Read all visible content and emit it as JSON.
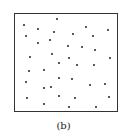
{
  "figure": {
    "caption": "(b)",
    "frame_color": "#333333",
    "dot_color": "#222222",
    "dots": [
      [
        57,
        19
      ],
      [
        24,
        25
      ],
      [
        38,
        29
      ],
      [
        86,
        27
      ],
      [
        108,
        30
      ],
      [
        26,
        36
      ],
      [
        54,
        32
      ],
      [
        73,
        34
      ],
      [
        93,
        36
      ],
      [
        38,
        43
      ],
      [
        50,
        40
      ],
      [
        68,
        46
      ],
      [
        82,
        47
      ],
      [
        95,
        50
      ],
      [
        30,
        57
      ],
      [
        52,
        54
      ],
      [
        69,
        58
      ],
      [
        110,
        58
      ],
      [
        59,
        63
      ],
      [
        77,
        65
      ],
      [
        94,
        65
      ],
      [
        29,
        71
      ],
      [
        44,
        70
      ],
      [
        59,
        78
      ],
      [
        72,
        79
      ],
      [
        26,
        82
      ],
      [
        90,
        85
      ],
      [
        105,
        84
      ],
      [
        44,
        88
      ],
      [
        51,
        87
      ],
      [
        27,
        98
      ],
      [
        59,
        96
      ],
      [
        75,
        98
      ],
      [
        109,
        97
      ],
      [
        44,
        104
      ],
      [
        69,
        107
      ],
      [
        96,
        107
      ]
    ]
  }
}
